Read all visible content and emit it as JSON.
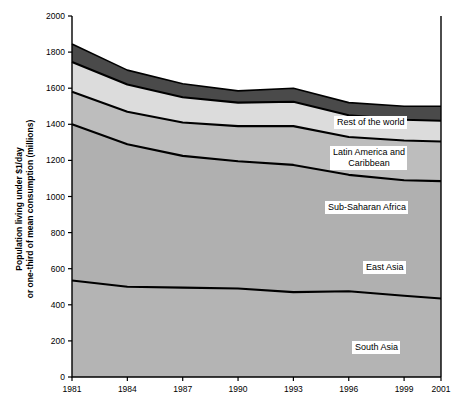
{
  "chart_data": {
    "type": "area",
    "stacked": true,
    "title": "",
    "xlabel": "",
    "ylabel": "Population living under $1/day\nor one-third of mean consumption (millions)",
    "ylabel_line1": "Population living under $1/day",
    "ylabel_line2": "or one-third of mean consumption (millions)",
    "x": [
      1981,
      1984,
      1987,
      1990,
      1993,
      1996,
      1999,
      2001
    ],
    "xtick_labels": [
      "1981",
      "1984",
      "1987",
      "1990",
      "1993",
      "1996",
      "1999",
      "2001"
    ],
    "ytick_labels": [
      "0",
      "200",
      "400",
      "600",
      "800",
      "1000",
      "1200",
      "1400",
      "1600",
      "1800",
      "2000"
    ],
    "ytick_values": [
      0,
      200,
      400,
      600,
      800,
      1000,
      1200,
      1400,
      1600,
      1800,
      2000
    ],
    "ylim": [
      0,
      2000
    ],
    "xlim": [
      1981,
      2001
    ],
    "grid": false,
    "legend_position": "inline-labels",
    "series": [
      {
        "name": "South Asia",
        "color": "#b4b4b4",
        "values": [
          535,
          500,
          495,
          490,
          470,
          475,
          450,
          435
        ],
        "cumulative": [
          535,
          500,
          495,
          490,
          470,
          475,
          450,
          435
        ]
      },
      {
        "name": "East Asia",
        "color": "#b0b0b0",
        "values": [
          865,
          790,
          730,
          705,
          705,
          645,
          640,
          650
        ],
        "cumulative": [
          1400,
          1290,
          1225,
          1195,
          1175,
          1120,
          1090,
          1085
        ]
      },
      {
        "name": "Sub-Saharan Africa",
        "color": "#bdbdbd",
        "values": [
          180,
          180,
          185,
          195,
          215,
          210,
          220,
          220
        ],
        "cumulative": [
          1580,
          1470,
          1410,
          1390,
          1390,
          1330,
          1310,
          1305
        ]
      },
      {
        "name": "Latin America and\nCaribbean",
        "color": "#dcdcdc",
        "values": [
          165,
          150,
          140,
          130,
          135,
          120,
          115,
          115
        ],
        "cumulative": [
          1745,
          1620,
          1550,
          1520,
          1525,
          1450,
          1425,
          1420
        ]
      },
      {
        "name": "Rest of the world",
        "color": "#4a4a4a",
        "values": [
          100,
          80,
          75,
          65,
          75,
          70,
          75,
          80
        ],
        "cumulative": [
          1845,
          1700,
          1625,
          1585,
          1600,
          1520,
          1500,
          1500
        ]
      }
    ],
    "inline_labels": [
      {
        "name": "Rest of the world",
        "text": "Rest of the world"
      },
      {
        "name": "Latin America and Caribbean",
        "text": "Latin America and\nCaribbean"
      },
      {
        "name": "Sub-Saharan Africa",
        "text": "Sub-Saharan Africa"
      },
      {
        "name": "East Asia",
        "text": "East Asia"
      },
      {
        "name": "South Asia",
        "text": "South Asia"
      }
    ],
    "axis_color": "#000000",
    "line_color": "#000000",
    "background": "#ffffff"
  }
}
